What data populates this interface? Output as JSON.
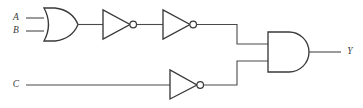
{
  "diagram": {
    "background_color": "#ffffff",
    "wire_color": "#4a4a4a",
    "gate_color": "#3a3a3a",
    "inputs": [
      {
        "id": "A",
        "label": "A",
        "x": 16,
        "y": 18
      },
      {
        "id": "B",
        "label": "B",
        "x": 16,
        "y": 31
      },
      {
        "id": "C",
        "label": "C",
        "x": 16,
        "y": 85
      }
    ],
    "outputs": [
      {
        "id": "Y",
        "label": "Y",
        "x": 348,
        "y": 52
      }
    ],
    "gates": [
      {
        "id": "or1",
        "type": "or",
        "label": "OR",
        "inputs": [
          "A",
          "B"
        ],
        "output": "n1"
      },
      {
        "id": "inv1",
        "type": "not",
        "label": "NOT",
        "inputs": [
          "n1"
        ],
        "output": "n2"
      },
      {
        "id": "inv2",
        "type": "not",
        "label": "NOT",
        "inputs": [
          "n2"
        ],
        "output": "n3"
      },
      {
        "id": "inv3",
        "type": "not",
        "label": "NOT",
        "inputs": [
          "C"
        ],
        "output": "n4"
      },
      {
        "id": "and1",
        "type": "and",
        "label": "AND",
        "inputs": [
          "n3",
          "n4"
        ],
        "output": "Y"
      }
    ],
    "nets": [
      "n1",
      "n2",
      "n3",
      "n4"
    ]
  }
}
